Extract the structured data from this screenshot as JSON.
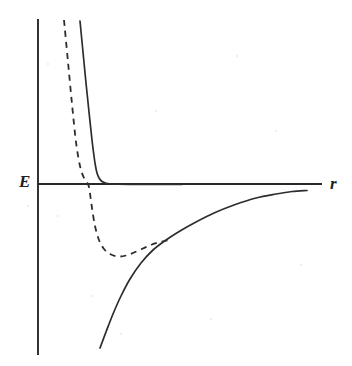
{
  "figure": {
    "background_color": "#ffffff",
    "ink_color": "#2b2d30",
    "width": 352,
    "height": 366,
    "axis_labels": {
      "y_axis": "E",
      "x_axis": "r"
    }
  },
  "chart_data": {
    "type": "line",
    "title": "",
    "subtitle": "",
    "xlabel": "r",
    "ylabel": "E",
    "grid": false,
    "legend": null,
    "legend_position": "none",
    "annotations": [],
    "axes": {
      "x_axis_origin_px": 38,
      "x_axis_end_px": 322,
      "y_axis_top_px": 19,
      "y_axis_bottom_px": 355,
      "zero_level_px": 184,
      "x_ticks": [],
      "y_ticks": [],
      "xlim": [
        0,
        1
      ],
      "ylim": [
        -1,
        1
      ]
    },
    "series": [
      {
        "name": "hard-core repulsion (solid)",
        "style": "solid",
        "color": "#2b2d30",
        "description": "steep repulsive wall falling from high positive energy and levelling off onto the zero line",
        "points_px": [
          [
            80,
            21
          ],
          [
            83,
            52
          ],
          [
            86,
            83
          ],
          [
            89,
            112
          ],
          [
            92,
            140
          ],
          [
            94,
            156
          ],
          [
            95.5,
            166
          ],
          [
            97,
            173
          ],
          [
            99,
            178
          ],
          [
            102,
            181.5
          ],
          [
            106,
            183.2
          ],
          [
            112,
            184
          ],
          [
            130,
            184.3
          ],
          [
            160,
            184.4
          ],
          [
            182,
            184.4
          ]
        ]
      },
      {
        "name": "attractive tail -1/r (solid)",
        "style": "solid",
        "color": "#2b2d30",
        "description": "long-range attractive branch rising from deep negative energy and approaching the zero line asymptotically",
        "points_px": [
          [
            100,
            348
          ],
          [
            106,
            332
          ],
          [
            113,
            314
          ],
          [
            121,
            296
          ],
          [
            130,
            279
          ],
          [
            141,
            263
          ],
          [
            153,
            250
          ],
          [
            166,
            240
          ],
          [
            180,
            231
          ],
          [
            196,
            222
          ],
          [
            214,
            213
          ],
          [
            234,
            205
          ],
          [
            256,
            198
          ],
          [
            276,
            194
          ],
          [
            292,
            191.5
          ],
          [
            307,
            190.5
          ]
        ]
      },
      {
        "name": "Lennard-Jones style potential (dashed)",
        "style": "dashed",
        "color": "#2b2d30",
        "description": "softer repulsive wall crossing zero, passing through a potential-energy minimum, then merging with the attractive tail",
        "points_px": [
          [
            64,
            20
          ],
          [
            68,
            62
          ],
          [
            72,
            104
          ],
          [
            76,
            142
          ],
          [
            80,
            166
          ],
          [
            84,
            178
          ],
          [
            88,
            184
          ],
          [
            89.5,
            190
          ],
          [
            92,
            208
          ],
          [
            95,
            226
          ],
          [
            99,
            240
          ],
          [
            104,
            249
          ],
          [
            110,
            254
          ],
          [
            118,
            256.5
          ],
          [
            126,
            255.5
          ],
          [
            134,
            252.5
          ],
          [
            143,
            248.5
          ],
          [
            152,
            244.5
          ],
          [
            162,
            241.5
          ],
          [
            172,
            239.5
          ]
        ]
      }
    ],
    "features": {
      "dashed_zero_crossing_px": [
        89,
        184
      ],
      "dashed_minimum_px": [
        120,
        256
      ],
      "dashed_merge_with_solid_tail_px": [
        172,
        240
      ],
      "solid_wall_knee_px": [
        97,
        172
      ],
      "solid_tail_asymptote_px": 190.5
    }
  },
  "specks": [
    {
      "x": 27,
      "y": 205,
      "d": 2
    },
    {
      "x": 57,
      "y": 215,
      "d": 2
    },
    {
      "x": 47,
      "y": 63,
      "d": 2
    },
    {
      "x": 155,
      "y": 110,
      "d": 2
    },
    {
      "x": 236,
      "y": 55,
      "d": 2
    },
    {
      "x": 300,
      "y": 264,
      "d": 2
    },
    {
      "x": 210,
      "y": 318,
      "d": 2
    },
    {
      "x": 120,
      "y": 333,
      "d": 2
    },
    {
      "x": 275,
      "y": 130,
      "d": 2
    },
    {
      "x": 91,
      "y": 295,
      "d": 2
    }
  ]
}
